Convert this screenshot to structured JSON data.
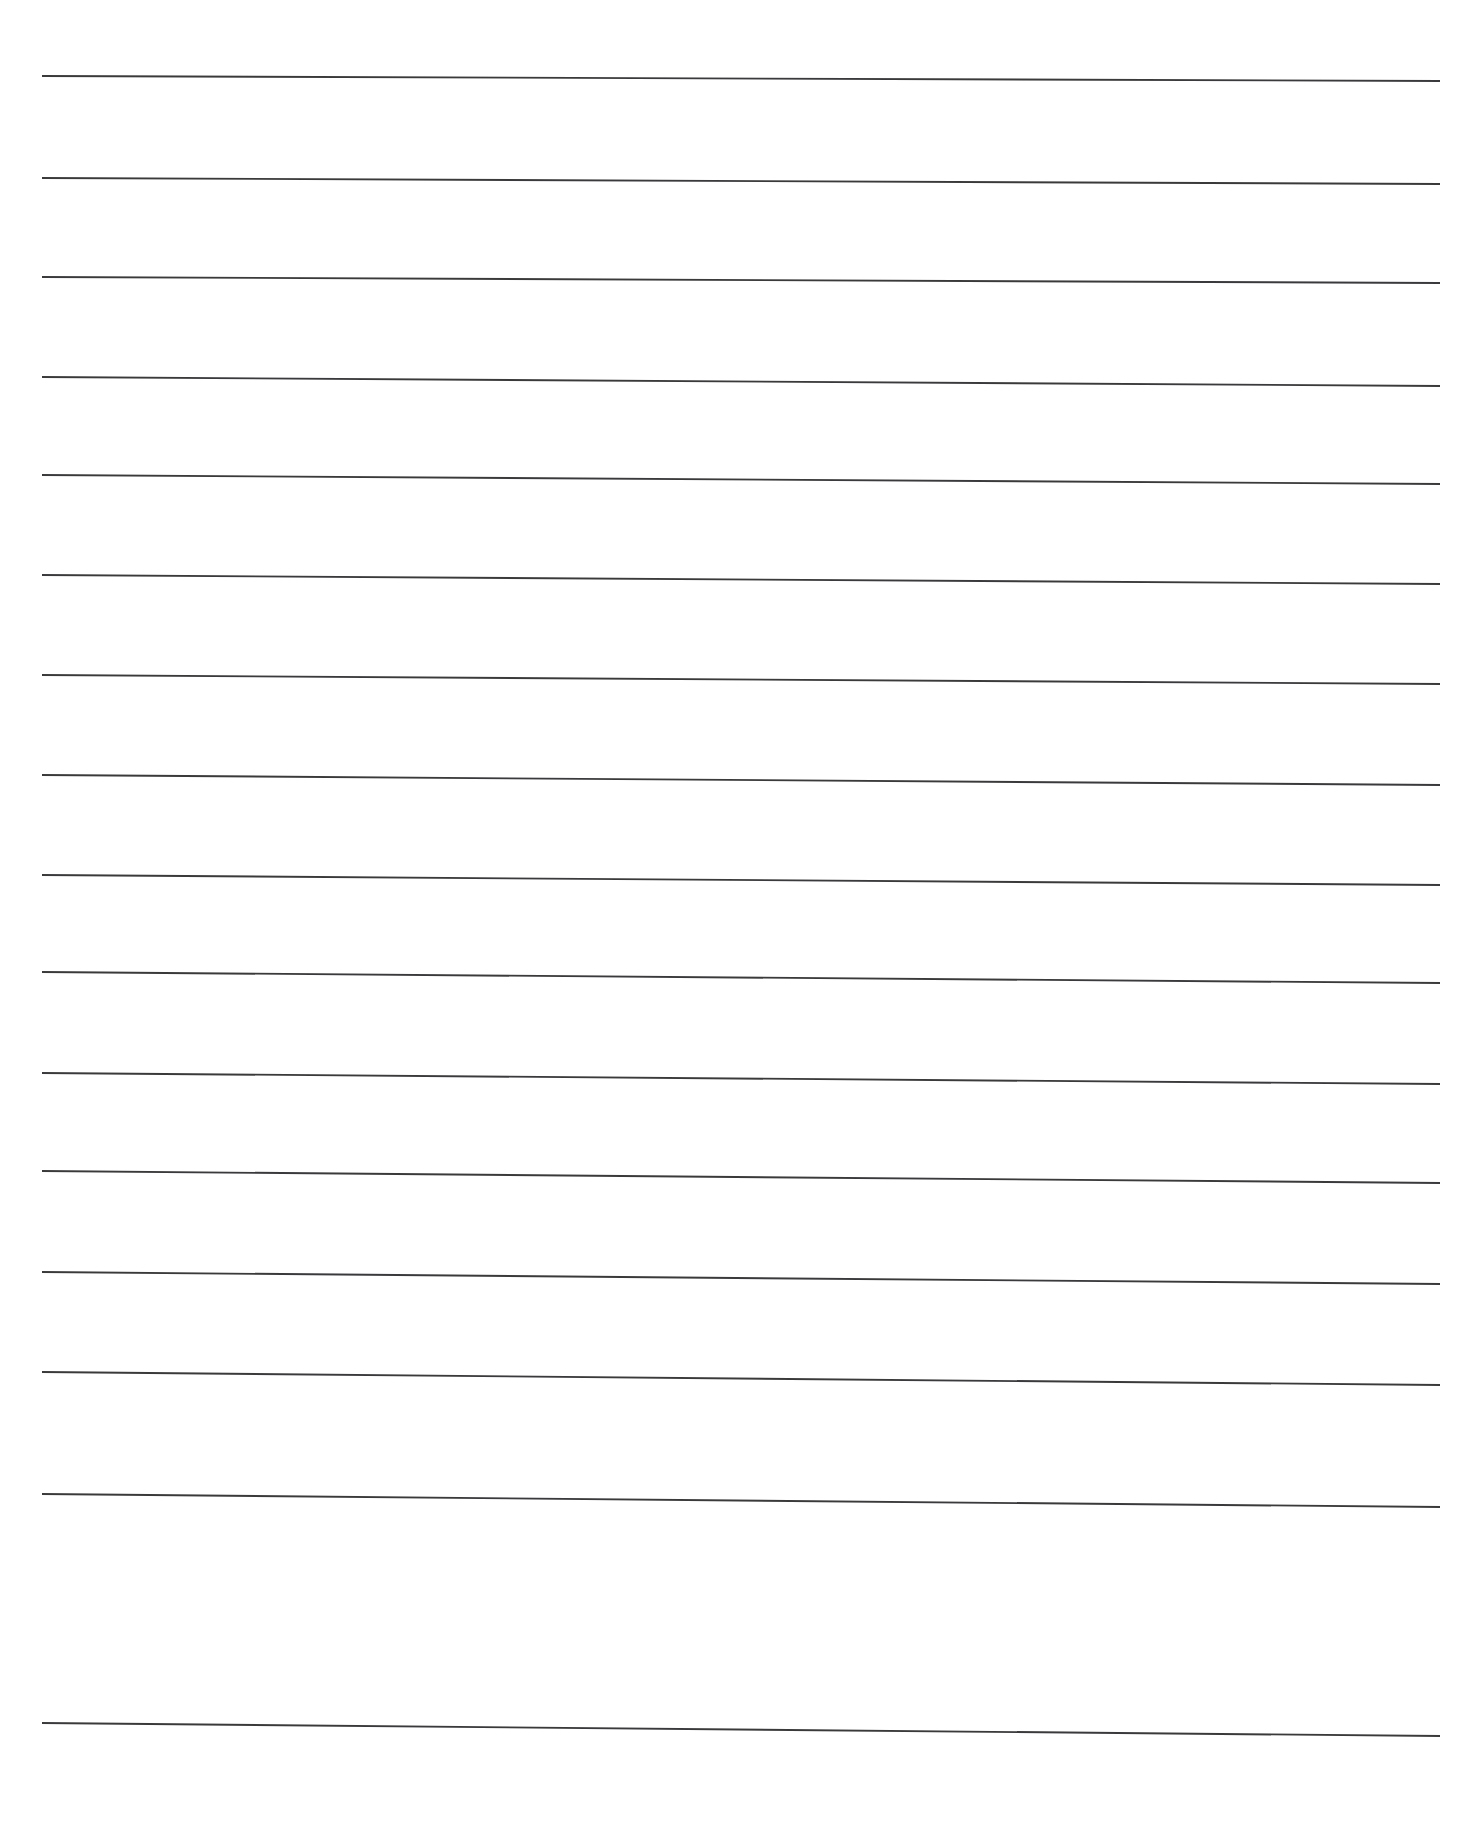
{
  "document": {
    "kind": "lined-writing-paper",
    "orientation": "portrait",
    "page_width": 1477,
    "page_height": 1845,
    "background_color": "#ffffff",
    "line_color": "#3a3a3c",
    "line_thickness": 1.9,
    "line_count": 16,
    "margin_left": 42,
    "margin_right": 1440,
    "first_line_y": 78,
    "line_spacing": 110,
    "text_content": "",
    "header_text": "",
    "footer_text": "",
    "notes": "Blank ruled paper; no printed text, no page numbers, no margins rules."
  },
  "ruled_lines": [
    {
      "index": 1,
      "x1": 42,
      "y1": 76,
      "x2": 1440,
      "y2": 81
    },
    {
      "index": 2,
      "x1": 42,
      "y1": 178,
      "x2": 1440,
      "y2": 184
    },
    {
      "index": 3,
      "x1": 42,
      "y1": 277,
      "x2": 1440,
      "y2": 283
    },
    {
      "index": 4,
      "x1": 42,
      "y1": 377,
      "x2": 1440,
      "y2": 386
    },
    {
      "index": 5,
      "x1": 42,
      "y1": 475,
      "x2": 1440,
      "y2": 484
    },
    {
      "index": 6,
      "x1": 42,
      "y1": 575,
      "x2": 1440,
      "y2": 584
    },
    {
      "index": 7,
      "x1": 42,
      "y1": 675,
      "x2": 1440,
      "y2": 684
    },
    {
      "index": 8,
      "x1": 42,
      "y1": 775,
      "x2": 1440,
      "y2": 785
    },
    {
      "index": 9,
      "x1": 42,
      "y1": 875,
      "x2": 1440,
      "y2": 885
    },
    {
      "index": 10,
      "x1": 42,
      "y1": 972,
      "x2": 1440,
      "y2": 983
    },
    {
      "index": 11,
      "x1": 42,
      "y1": 1073,
      "x2": 1440,
      "y2": 1084
    },
    {
      "index": 12,
      "x1": 42,
      "y1": 1171,
      "x2": 1440,
      "y2": 1183
    },
    {
      "index": 13,
      "x1": 42,
      "y1": 1272,
      "x2": 1440,
      "y2": 1284
    },
    {
      "index": 14,
      "x1": 42,
      "y1": 1372,
      "x2": 1440,
      "y2": 1385
    },
    {
      "index": 15,
      "x1": 42,
      "y1": 1494,
      "x2": 1440,
      "y2": 1507
    },
    {
      "index": 16,
      "x1": 42,
      "y1": 1723,
      "x2": 1440,
      "y2": 1736
    }
  ]
}
